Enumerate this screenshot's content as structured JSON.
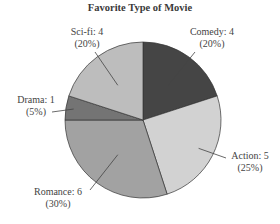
{
  "chart_data": {
    "type": "pie",
    "title": "Favorite Type of Movie",
    "categories": [
      "Comedy",
      "Action",
      "Romance",
      "Drama",
      "Sci-fi"
    ],
    "values": [
      4,
      5,
      6,
      1,
      4
    ],
    "percents": [
      20,
      25,
      30,
      5,
      20
    ],
    "colors": [
      "#454545",
      "#d2d2d2",
      "#a2a2a2",
      "#747474",
      "#bdbdbd"
    ],
    "start_angle": "12 o'clock",
    "direction": "clockwise",
    "labels": [
      {
        "name": "Comedy",
        "line1": "Comedy: 4",
        "line2": "(20%)"
      },
      {
        "name": "Action",
        "line1": "Action: 5",
        "line2": "(25%)"
      },
      {
        "name": "Romance",
        "line1": "Romance: 6",
        "line2": "(30%)"
      },
      {
        "name": "Drama",
        "line1": "Drama: 1",
        "line2": "(5%)"
      },
      {
        "name": "Sci-fi",
        "line1": "Sci-fi: 4",
        "line2": "(20%)"
      }
    ]
  }
}
